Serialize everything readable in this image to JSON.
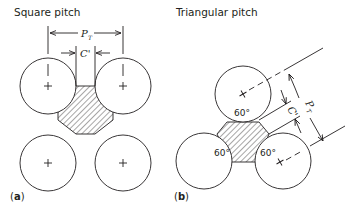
{
  "panel_a": {
    "title": "Square pitch",
    "pitch_label": "P",
    "pitch_sub": "T",
    "clearance_label": "C'",
    "panel_label_open": "(",
    "panel_label_letter": "a",
    "panel_label_close": ")"
  },
  "panel_b": {
    "title": "Triangular pitch",
    "pitch_label": "P",
    "pitch_sub": "T",
    "clearance_label": "C'",
    "angles": [
      "60°",
      "60°",
      "60°"
    ],
    "panel_label_open": "(",
    "panel_label_letter": "b",
    "panel_label_close": ")"
  },
  "colors": {
    "line": "#231f20",
    "background": "#ffffff"
  }
}
